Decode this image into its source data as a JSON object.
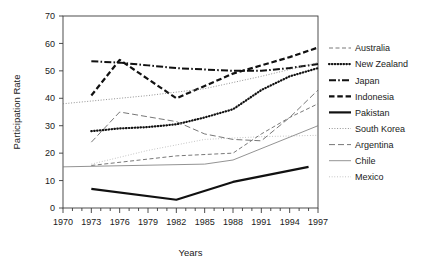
{
  "chart_data": {
    "type": "line",
    "title": "",
    "xlabel": "Years",
    "ylabel": "Participation Rate",
    "xlim": [
      1970,
      1997
    ],
    "ylim": [
      0,
      70
    ],
    "ytick_labels": [
      "0",
      "10",
      "20",
      "30",
      "40",
      "50",
      "60",
      "70"
    ],
    "ytick_values": [
      0,
      10,
      20,
      30,
      40,
      50,
      60,
      70
    ],
    "xtick_labels": [
      "1970",
      "1973",
      "1976",
      "1979",
      "1982",
      "1985",
      "1988",
      "1991",
      "1994",
      "1997"
    ],
    "xtick_values": [
      1970,
      1973,
      1976,
      1979,
      1982,
      1985,
      1988,
      1991,
      1994,
      1997
    ],
    "minor_xticks": "every 1 year",
    "grid": false,
    "legend_position": "right",
    "series": [
      {
        "name": "Australia",
        "style": "dashed-thin",
        "color": "#555555",
        "x": [
          1973,
          1982,
          1988,
          1991,
          1994,
          1997
        ],
        "values": [
          15.5,
          19.0,
          20.0,
          27.0,
          33.0,
          38.0
        ]
      },
      {
        "name": "New Zealand",
        "style": "dotted-bold",
        "color": "#111111",
        "x": [
          1973,
          1976,
          1979,
          1982,
          1985,
          1988,
          1991,
          1994,
          1997
        ],
        "values": [
          28.0,
          29.0,
          29.5,
          30.5,
          33.0,
          36.0,
          43.0,
          48.0,
          51.0
        ]
      },
      {
        "name": "Japan",
        "style": "dashdot-bold",
        "color": "#111111",
        "x": [
          1973,
          1976,
          1979,
          1982,
          1985,
          1988,
          1991,
          1994,
          1997
        ],
        "values": [
          53.5,
          53.0,
          52.0,
          51.0,
          50.5,
          50.0,
          50.0,
          51.0,
          52.5
        ]
      },
      {
        "name": "Indonesia",
        "style": "dashed-bold",
        "color": "#111111",
        "x": [
          1973,
          1976,
          1979,
          1982,
          1985,
          1988,
          1991,
          1994,
          1997
        ],
        "values": [
          41.0,
          54.0,
          47.0,
          40.0,
          44.5,
          49.0,
          52.0,
          55.0,
          58.5
        ]
      },
      {
        "name": "Pakistan",
        "style": "solid-bold",
        "color": "#111111",
        "x": [
          1973,
          1982,
          1988,
          1996
        ],
        "values": [
          7.0,
          3.0,
          9.5,
          15.0
        ]
      },
      {
        "name": "South Korea",
        "style": "dotted-thin",
        "color": "#777777",
        "x": [
          1970,
          1979,
          1985,
          1991,
          1997
        ],
        "values": [
          38.0,
          41.0,
          43.5,
          48.0,
          53.0
        ]
      },
      {
        "name": "Argentina",
        "style": "dashed-medium",
        "color": "#666666",
        "x": [
          1973,
          1976,
          1982,
          1985,
          1988,
          1991,
          1994,
          1997
        ],
        "values": [
          24.0,
          35.0,
          31.5,
          27.0,
          25.0,
          24.5,
          33.0,
          43.0
        ]
      },
      {
        "name": "Chile",
        "style": "solid-thin",
        "color": "#777777",
        "x": [
          1970,
          1985,
          1988,
          1997
        ],
        "values": [
          15.0,
          16.0,
          17.5,
          30.0
        ]
      },
      {
        "name": "Mexico",
        "style": "dotted-fine",
        "color": "#999999",
        "x": [
          1973,
          1979,
          1985,
          1991,
          1997
        ],
        "values": [
          16.0,
          21.0,
          25.0,
          26.0,
          26.5
        ]
      }
    ]
  },
  "legend": {
    "entries": [
      "Australia",
      "New Zealand",
      "Japan",
      "Indonesia",
      "Pakistan",
      "South Korea",
      "Argentina",
      "Chile",
      "Mexico"
    ]
  }
}
